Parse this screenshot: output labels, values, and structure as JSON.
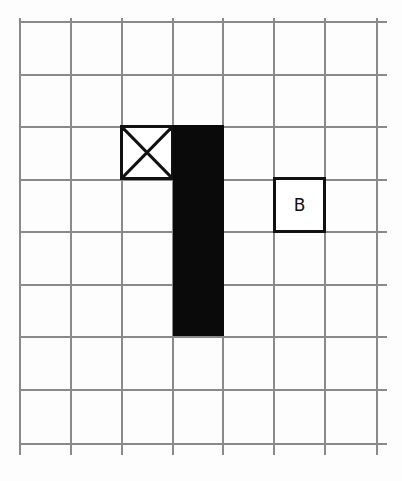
{
  "diagram": {
    "type": "grid-map",
    "columns": 7,
    "rows": 8,
    "cell_size_px": 51,
    "colors": {
      "grid_line": "#8a8a8a",
      "wall": "#0a0a0a",
      "border": "#111111"
    },
    "x_cell": {
      "col": 2,
      "row": 2,
      "icon": "crossed-box-icon"
    },
    "wall": {
      "col": 3,
      "row_start": 2,
      "row_end": 5
    },
    "b_cell": {
      "col": 5,
      "row": 3,
      "label": "B"
    }
  }
}
